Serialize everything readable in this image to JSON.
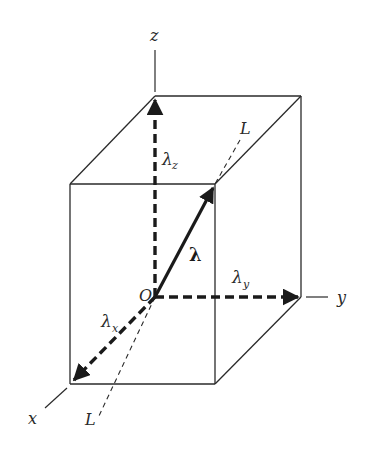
{
  "diagram": {
    "axes": {
      "x": {
        "label": "x"
      },
      "y": {
        "label": "y"
      },
      "z": {
        "label": "z"
      }
    },
    "origin": {
      "label": "O"
    },
    "line": {
      "label_top": "L",
      "label_bottom": "L"
    },
    "vector": {
      "label": "λ"
    },
    "components": {
      "x": {
        "symbol": "λ",
        "subscript": "x"
      },
      "y": {
        "symbol": "λ",
        "subscript": "y"
      },
      "z": {
        "symbol": "λ",
        "subscript": "z"
      }
    },
    "colors": {
      "stroke": "#2a2a2a",
      "background": "#ffffff"
    }
  }
}
